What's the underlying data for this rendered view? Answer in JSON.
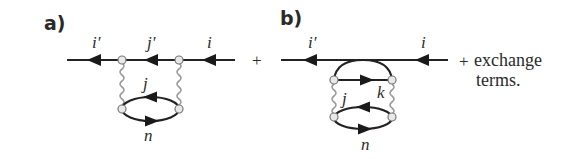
{
  "figure": {
    "panel_a": {
      "label": "a)",
      "external_line": {
        "in_label": "i",
        "middle_label": "j'",
        "out_label": "i'"
      },
      "loop": {
        "upper_label": "j",
        "lower_label": "n"
      },
      "interaction_lines": 2
    },
    "operator_between": "+",
    "panel_b": {
      "label": "b)",
      "external_line": {
        "in_label": "i",
        "out_label": "i'"
      },
      "inner_line_label": "k",
      "left_label": "j",
      "loop": {
        "lower_label": "n"
      },
      "interaction_lines": 2
    },
    "suffix": {
      "plus": "+",
      "line1": "exchange",
      "line2": "terms."
    }
  },
  "colors": {
    "line": "#222222",
    "interaction": "#9a9a9a",
    "vertex_fill": "#e8e8e8",
    "text": "#2a2a2a"
  }
}
